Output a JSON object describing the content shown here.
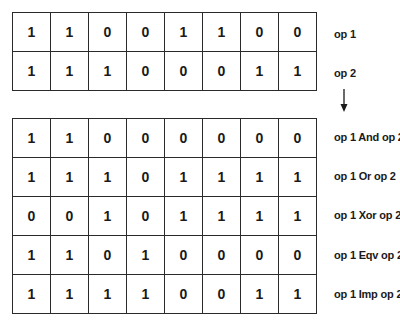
{
  "operands": {
    "rows": [
      {
        "label": "op 1",
        "bits": [
          "1",
          "1",
          "0",
          "0",
          "1",
          "1",
          "0",
          "0"
        ]
      },
      {
        "label": "op 2",
        "bits": [
          "1",
          "1",
          "1",
          "0",
          "0",
          "0",
          "1",
          "1"
        ]
      }
    ]
  },
  "arrow_icon": "down-arrow",
  "results": {
    "rows": [
      {
        "label": "op 1 And op 2",
        "bits": [
          "1",
          "1",
          "0",
          "0",
          "0",
          "0",
          "0",
          "0"
        ]
      },
      {
        "label": "op 1 Or op 2",
        "bits": [
          "1",
          "1",
          "1",
          "0",
          "1",
          "1",
          "1",
          "1"
        ]
      },
      {
        "label": "op 1 Xor op 2",
        "bits": [
          "0",
          "0",
          "1",
          "0",
          "1",
          "1",
          "1",
          "1"
        ]
      },
      {
        "label": "op 1 Eqv op 2",
        "bits": [
          "1",
          "1",
          "0",
          "1",
          "0",
          "0",
          "0",
          "0"
        ]
      },
      {
        "label": "op 1 Imp op 2",
        "bits": [
          "1",
          "1",
          "1",
          "1",
          "0",
          "0",
          "1",
          "1"
        ]
      }
    ]
  }
}
